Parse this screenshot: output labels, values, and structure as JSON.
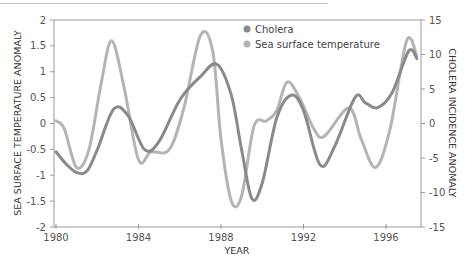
{
  "chart_data": {
    "type": "line",
    "title": "",
    "xlabel": "YEAR",
    "ylabel": "SEA SURFACE TEMPERATURE ANOMALY",
    "y2label": "CHOLERA INCIDENCE ANOMALY",
    "xlim": [
      1980,
      1998
    ],
    "ylim": [
      -2,
      2
    ],
    "y2lim": [
      -15,
      15
    ],
    "x_ticks": [
      "1980",
      "1984",
      "1988",
      "1992",
      "1996"
    ],
    "y_ticks": [
      "2",
      "1.5",
      "1",
      "0.5",
      "0",
      "-0.5",
      "-1",
      "-1.5",
      "-2"
    ],
    "y2_ticks": [
      "15",
      "10",
      "5",
      "0",
      "-5",
      "-10",
      "-15"
    ],
    "grid": false,
    "legend_position": "top-center",
    "legend": [
      "Cholera",
      "Sea surface temperature"
    ],
    "series": [
      {
        "name": "Cholera",
        "axis": "right",
        "color": "#8a8a8a",
        "x": [
          1980.0,
          1980.5,
          1981.0,
          1981.5,
          1982.0,
          1982.8,
          1983.5,
          1984.3,
          1985.0,
          1986.0,
          1987.0,
          1987.8,
          1988.5,
          1989.0,
          1989.5,
          1990.0,
          1990.7,
          1991.4,
          1992.0,
          1992.8,
          1993.5,
          1994.5,
          1995.0,
          1995.6,
          1996.3,
          1997.1,
          1997.5
        ],
        "values": [
          -4.1,
          -5.9,
          -7.1,
          -6.9,
          -3.8,
          2.1,
          1.1,
          -3.8,
          -2.6,
          3.4,
          6.8,
          8.6,
          4.1,
          -3.8,
          -10.9,
          -8.6,
          0.8,
          4.1,
          1.9,
          -6.0,
          -3.4,
          3.8,
          3.0,
          2.3,
          4.5,
          10.5,
          9.4
        ]
      },
      {
        "name": "Sea surface temperature",
        "axis": "left",
        "color": "#b4b4b4",
        "x": [
          1980.0,
          1980.4,
          1981.0,
          1981.6,
          1982.2,
          1982.7,
          1983.3,
          1984.0,
          1984.6,
          1985.5,
          1986.2,
          1987.0,
          1987.6,
          1988.0,
          1988.5,
          1989.0,
          1989.6,
          1990.2,
          1990.7,
          1991.2,
          1991.8,
          1992.5,
          1993.0,
          1994.2,
          1994.8,
          1995.5,
          1996.2,
          1997.0,
          1997.5
        ],
        "values": [
          0.05,
          -0.1,
          -0.85,
          -0.5,
          0.8,
          1.6,
          0.7,
          -0.7,
          -0.55,
          -0.5,
          0.3,
          1.7,
          1.4,
          -0.3,
          -1.5,
          -1.4,
          -0.05,
          0.05,
          0.25,
          0.8,
          0.5,
          -0.1,
          -0.25,
          0.3,
          -0.3,
          -0.85,
          -0.1,
          1.6,
          1.3
        ]
      }
    ]
  },
  "legend": {
    "items": [
      {
        "label": "Cholera",
        "color": "#8a8a8a"
      },
      {
        "label": "Sea surface temperature",
        "color": "#b4b4b4"
      }
    ]
  }
}
